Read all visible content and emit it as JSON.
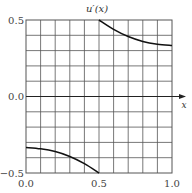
{
  "chart_data": {
    "type": "line",
    "title": "u′(x)",
    "xlabel": "x",
    "ylabel": "",
    "xlim": [
      0.0,
      1.0
    ],
    "ylim": [
      -0.5,
      0.5
    ],
    "grid": true,
    "grid_divisions": {
      "x": 10,
      "y": 10
    },
    "x_ticks": [
      "0.0",
      "0.5",
      "1.0"
    ],
    "y_ticks": [
      "-0.5",
      "0.0",
      "0.5"
    ],
    "y_tick_labels": [
      "−0.5",
      "0.0",
      "0.5"
    ],
    "series": [
      {
        "name": "u′(x) left branch",
        "x": [
          0.0,
          0.1,
          0.2,
          0.3,
          0.4,
          0.5
        ],
        "y": [
          -0.333,
          -0.342,
          -0.36,
          -0.392,
          -0.439,
          -0.5
        ]
      },
      {
        "name": "u′(x) right branch",
        "x": [
          0.5,
          0.6,
          0.7,
          0.8,
          0.9,
          1.0
        ],
        "y": [
          0.5,
          0.439,
          0.392,
          0.36,
          0.342,
          0.333
        ]
      }
    ],
    "annotations": [
      "arrow on x-axis at y=0"
    ],
    "legend": "none"
  },
  "colors": {
    "grid": "#555555",
    "curve": "#111111",
    "background": "#ffffff"
  }
}
